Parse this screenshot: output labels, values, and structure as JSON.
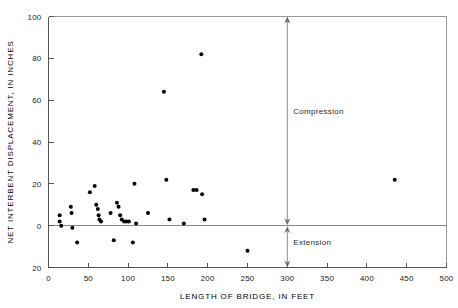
{
  "figure": {
    "title": "",
    "background": "#ffffff",
    "point_color": "#000000",
    "axis_color": "#555555"
  },
  "labels": {
    "xlabel": "LENGTH OF BRIDGE, IN FEET",
    "ylabel": "NET INTERBENT DISPLACEMENT, IN INCHES",
    "annotation_compression": "Compression",
    "annotation_extension": "Extension"
  },
  "xticks": [
    "0",
    "50",
    "100",
    "150",
    "200",
    "250",
    "300",
    "350",
    "400",
    "450",
    "500"
  ],
  "yticks": [
    "100",
    "80",
    "60",
    "40",
    "20",
    "0",
    "20"
  ],
  "chart_data": {
    "type": "scatter",
    "title": "",
    "xlabel": "LENGTH OF BRIDGE, IN FEET",
    "ylabel": "NET INTERBENT DISPLACEMENT, IN INCHES",
    "xlim": [
      0,
      500
    ],
    "ylim": [
      -20,
      100
    ],
    "xtick_values": [
      0,
      50,
      100,
      150,
      200,
      250,
      300,
      350,
      400,
      450,
      500
    ],
    "ytick_values": [
      100,
      80,
      60,
      40,
      20,
      0,
      -20
    ],
    "ytick_labels": [
      "100",
      "80",
      "60",
      "40",
      "20",
      "0",
      "20"
    ],
    "grid": false,
    "legend": null,
    "zero_reference_line": 0,
    "annotations": [
      {
        "text": "Compression",
        "x": 300,
        "y": 55,
        "direction": "up",
        "arrow_from": 0,
        "arrow_to": 100
      },
      {
        "text": "Extension",
        "x": 300,
        "y": -8,
        "direction": "down",
        "arrow_from": 0,
        "arrow_to": -20
      }
    ],
    "points": [
      {
        "x": 14,
        "y": 5
      },
      {
        "x": 14,
        "y": 2
      },
      {
        "x": 16,
        "y": 0
      },
      {
        "x": 28,
        "y": 9
      },
      {
        "x": 29,
        "y": 6
      },
      {
        "x": 30,
        "y": -1
      },
      {
        "x": 36,
        "y": -8
      },
      {
        "x": 52,
        "y": 16
      },
      {
        "x": 58,
        "y": 19
      },
      {
        "x": 60,
        "y": 10
      },
      {
        "x": 62,
        "y": 8
      },
      {
        "x": 63,
        "y": 5
      },
      {
        "x": 64,
        "y": 3
      },
      {
        "x": 66,
        "y": 2
      },
      {
        "x": 78,
        "y": 6
      },
      {
        "x": 86,
        "y": 11
      },
      {
        "x": 88,
        "y": 9
      },
      {
        "x": 90,
        "y": 5
      },
      {
        "x": 92,
        "y": 3
      },
      {
        "x": 95,
        "y": 2
      },
      {
        "x": 98,
        "y": 2
      },
      {
        "x": 101,
        "y": 2
      },
      {
        "x": 82,
        "y": -7
      },
      {
        "x": 106,
        "y": -8
      },
      {
        "x": 108,
        "y": 20
      },
      {
        "x": 110,
        "y": 1
      },
      {
        "x": 125,
        "y": 6
      },
      {
        "x": 145,
        "y": 64
      },
      {
        "x": 148,
        "y": 22
      },
      {
        "x": 152,
        "y": 3
      },
      {
        "x": 170,
        "y": 1
      },
      {
        "x": 182,
        "y": 17
      },
      {
        "x": 186,
        "y": 17
      },
      {
        "x": 192,
        "y": 82
      },
      {
        "x": 193,
        "y": 15
      },
      {
        "x": 196,
        "y": 3
      },
      {
        "x": 250,
        "y": -12
      },
      {
        "x": 435,
        "y": 22
      }
    ]
  }
}
